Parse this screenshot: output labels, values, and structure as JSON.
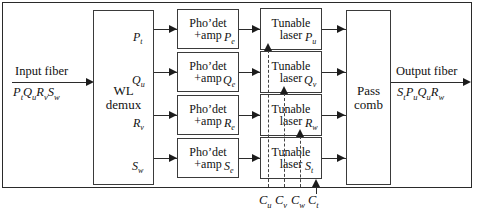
{
  "diagram": {
    "input_fiber": {
      "label": "Input fiber",
      "channels": "P t Q u R v S w"
    },
    "output_fiber": {
      "label": "Output fiber",
      "channels": "S t P u Q u R w"
    },
    "demux": {
      "line1": "WL",
      "line2": "demux"
    },
    "combiner": {
      "line1": "Pass",
      "line2": "comb"
    },
    "detector": {
      "line1": "Pho’det",
      "line2": "+amp"
    },
    "laser": {
      "line1": "Tunable",
      "line2": "laser"
    },
    "rows": [
      {
        "demux_out": "P",
        "demux_out_sub": "t",
        "det_out": "P",
        "det_out_sub": "e",
        "laser_out": "P",
        "laser_out_sub": "u"
      },
      {
        "demux_out": "Q",
        "demux_out_sub": "u",
        "det_out": "Q",
        "det_out_sub": "e",
        "laser_out": "Q",
        "laser_out_sub": "v"
      },
      {
        "demux_out": "R",
        "demux_out_sub": "v",
        "det_out": "R",
        "det_out_sub": "e",
        "laser_out": "R",
        "laser_out_sub": "w"
      },
      {
        "demux_out": "S",
        "demux_out_sub": "w",
        "det_out": "S",
        "det_out_sub": "e",
        "laser_out": "S",
        "laser_out_sub": "t"
      }
    ],
    "control": {
      "signals": [
        {
          "sym": "C",
          "sub": "u"
        },
        {
          "sym": "C",
          "sub": "v"
        },
        {
          "sym": "C",
          "sub": "w"
        },
        {
          "sym": "C",
          "sub": "t"
        }
      ]
    },
    "colors": {
      "stroke": "#2b2b2b",
      "text": "#111111",
      "background": "#ffffff"
    }
  }
}
